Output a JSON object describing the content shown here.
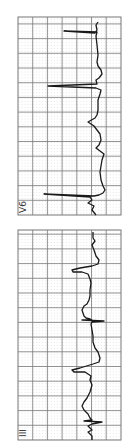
{
  "strips": [
    {
      "lead": "V6",
      "box": {
        "x": 18,
        "y": 17,
        "w": 103,
        "h": 198
      },
      "trace": "98,22 96,25 97,30 95,33 64,31 97,32 96,36 97,45 98,55 97,62 98,66 101,70 102,74 99,78 96,80 97,84 48,86 96,88 101,90 100,94 98,100 98,110 97,115 95,118 88,122 94,126 97,130 100,134 101,140 99,145 96,148 104,154 102,160 100,172 101,180 103,186 105,190 103,193 99,195 94,196 44,194 90,197 92,200 88,203 94,206 92,210 96,215"
    },
    {
      "lead": "III",
      "box": {
        "x": 18,
        "y": 230,
        "w": 103,
        "h": 210
      },
      "trace": "93,232 93,238 95,241 92,245 94,250 96,256 99,260 98,264 92,266 80,268 72,270 73,272 82,272 88,274 90,279 91,283 90,290 90,296 89,300 87,304 84,306 82,310 84,316 86,318 90,319 92,320 82,320 104,321 92,322 91,324 92,330 93,336 93,342 95,348 98,352 100,358 99,362 93,364 80,368 72,370 74,372 85,372 91,376 90,380 92,385 90,392 87,398 84,402 82,406 84,410 88,414 90,418 92,420 84,421 102,422 92,424 88,426 92,430 88,432 92,436 92,440"
    }
  ],
  "colors": {
    "grid_major": "#777777",
    "grid_minor": "#9a9a9a",
    "trace": "#1a1a1a",
    "label": "#333333"
  }
}
